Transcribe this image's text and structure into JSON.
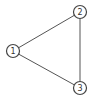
{
  "diagram": {
    "type": "undirected-graph",
    "nodes": [
      {
        "id": "1",
        "label": "1",
        "x": 13,
        "y": 51
      },
      {
        "id": "2",
        "label": "2",
        "x": 80,
        "y": 12
      },
      {
        "id": "3",
        "label": "3",
        "x": 80,
        "y": 88
      }
    ],
    "edges": [
      {
        "from": "1",
        "to": "2"
      },
      {
        "from": "2",
        "to": "3"
      },
      {
        "from": "1",
        "to": "3"
      }
    ],
    "node_radius": 6.5,
    "colors": {
      "edge": "#555555",
      "node_stroke": "#444444",
      "label": "#333333",
      "background": "#ffffff"
    }
  }
}
